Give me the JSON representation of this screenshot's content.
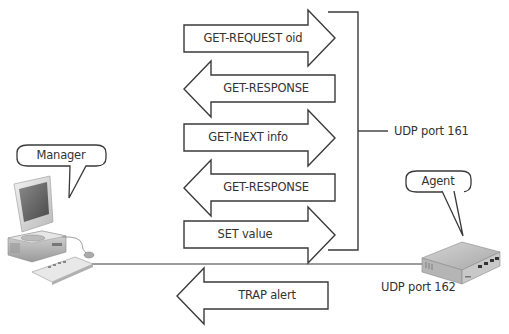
{
  "diagram": {
    "colors": {
      "stroke": "#3a3a3a",
      "text": "#333333",
      "fill": "#ffffff"
    },
    "messages": [
      {
        "label": "GET-REQUEST oid",
        "direction": "right"
      },
      {
        "label": "GET-RESPONSE",
        "direction": "left"
      },
      {
        "label": "GET-NEXT info",
        "direction": "right"
      },
      {
        "label": "GET-RESPONSE",
        "direction": "left"
      },
      {
        "label": "SET value",
        "direction": "right"
      }
    ],
    "trap": {
      "label": "TRAP alert",
      "direction": "left"
    },
    "bracket_label": "UDP port 161",
    "agent_port_label": "UDP port 162",
    "manager": {
      "label": "Manager",
      "icon": "desktop-computer-icon"
    },
    "agent": {
      "label": "Agent",
      "icon": "network-switch-icon"
    }
  }
}
